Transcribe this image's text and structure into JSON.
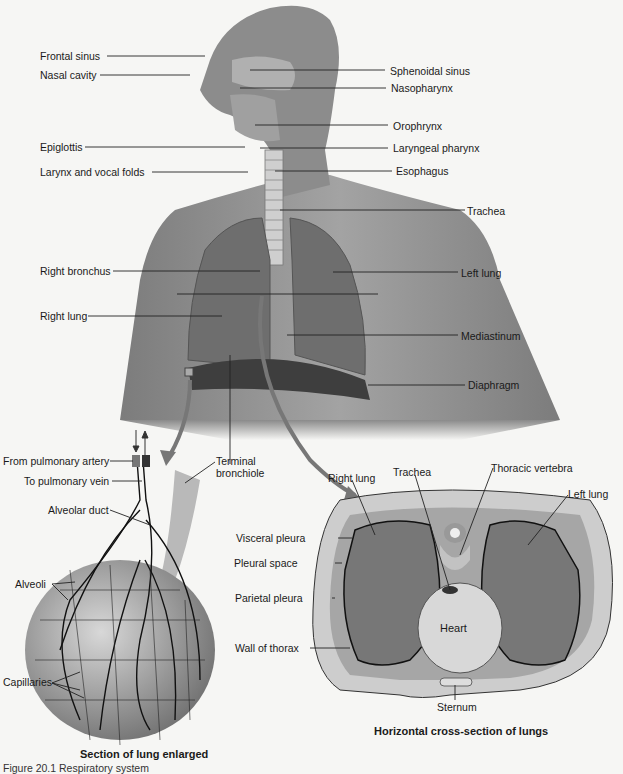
{
  "figure": {
    "caption": "Figure 20.1 Respiratory system",
    "colors": {
      "background": "#f6f6f4",
      "skin": "#8a8a8a",
      "lung": "#6e6e6e",
      "cross_section_lung": "#777777",
      "tissue_light": "#d4d4d4",
      "ink": "#1a1a1a"
    }
  },
  "upper_body": {
    "labels_left": [
      {
        "id": "frontal-sinus",
        "text": "Frontal sinus"
      },
      {
        "id": "nasal-cavity",
        "text": "Nasal cavity"
      },
      {
        "id": "epiglottis",
        "text": "Epiglottis"
      },
      {
        "id": "larynx-vocal-folds",
        "text": "Larynx and vocal folds"
      },
      {
        "id": "right-bronchus",
        "text": "Right bronchus"
      },
      {
        "id": "right-lung",
        "text": "Right lung"
      }
    ],
    "labels_right": [
      {
        "id": "sphenoidal-sinus",
        "text": "Sphenoidal sinus"
      },
      {
        "id": "nasopharynx",
        "text": "Nasopharynx"
      },
      {
        "id": "orophrynx",
        "text": "Orophrynx"
      },
      {
        "id": "laryngeal-pharynx",
        "text": "Laryngeal pharynx"
      },
      {
        "id": "esophagus",
        "text": "Esophagus"
      },
      {
        "id": "trachea",
        "text": "Trachea"
      },
      {
        "id": "left-lung",
        "text": "Left lung"
      },
      {
        "id": "mediastinum",
        "text": "Mediastinum"
      },
      {
        "id": "diaphragm",
        "text": "Diaphragm"
      }
    ],
    "terminal_bronchiole": {
      "line1": "Terminal",
      "line2": "bronchiole"
    }
  },
  "lung_section": {
    "title": "Section of lung enlarged",
    "labels": [
      {
        "id": "from-pulmonary-artery",
        "text": "From pulmonary artery"
      },
      {
        "id": "to-pulmonary-vein",
        "text": "To pulmonary vein"
      },
      {
        "id": "alveolar-duct",
        "text": "Alveolar duct"
      },
      {
        "id": "alveoli",
        "text": "Alveoli"
      },
      {
        "id": "capillaries",
        "text": "Capillaries"
      }
    ]
  },
  "cross_section": {
    "title": "Horizontal cross-section of lungs",
    "labels_top": [
      {
        "id": "cs-right-lung",
        "text": "Right lung"
      },
      {
        "id": "cs-trachea",
        "text": "Trachea"
      },
      {
        "id": "thoracic-vertebra",
        "text": "Thoracic vertebra"
      },
      {
        "id": "cs-left-lung",
        "text": "Left lung"
      }
    ],
    "labels_left": [
      {
        "id": "visceral-pleura",
        "text": "Visceral pleura"
      },
      {
        "id": "pleural-space",
        "text": "Pleural space"
      },
      {
        "id": "parietal-pleura",
        "text": "Parietal pleura"
      },
      {
        "id": "wall-of-thorax",
        "text": "Wall of thorax"
      }
    ],
    "heart": "Heart",
    "sternum": "Sternum"
  }
}
